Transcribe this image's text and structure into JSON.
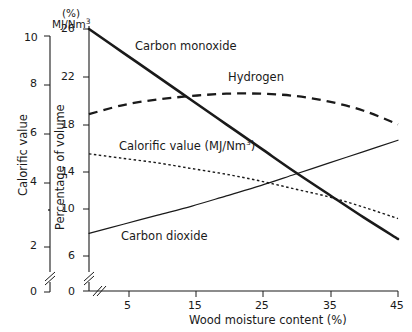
{
  "chart_data": {
    "type": "line",
    "title": "",
    "xlabel": "Wood moisture content (%)",
    "ylabel_left": "Calorific value",
    "ylabel_right": "Percentage of volume",
    "unit_left": "MJ/Nm",
    "unit_left_sup": "3",
    "unit_right": "(%)",
    "xlim": [
      0,
      45
    ],
    "xticks": [
      5,
      15,
      25,
      35,
      45
    ],
    "xticklabels": [
      "5",
      "15",
      "25",
      "35",
      "45"
    ],
    "ylim_left": [
      0,
      10
    ],
    "yticks_left": [
      0,
      2,
      4,
      6,
      8,
      10
    ],
    "yticklabels_left": [
      "0",
      "2",
      "4",
      "6",
      "8",
      "10"
    ],
    "ylim_right": [
      0,
      26
    ],
    "yticks_right": [
      0,
      6,
      10,
      14,
      18,
      22,
      26
    ],
    "yticklabels_right": [
      "0",
      "6",
      "10",
      "14",
      "18",
      "22",
      "26"
    ],
    "axis_break_left": true,
    "axis_break_bottom": true,
    "grid": false,
    "legend": "inline-labels",
    "series": [
      {
        "name": "Carbon monoxide",
        "label": "Carbon monoxide",
        "style": "solid-thick",
        "color": "#1a1a1a",
        "axis": "right",
        "x": [
          0,
          5,
          10,
          15,
          20,
          25,
          30,
          35,
          40,
          45
        ],
        "values": [
          26.0,
          23.9,
          21.8,
          19.7,
          17.6,
          15.5,
          13.4,
          11.4,
          9.4,
          7.5
        ]
      },
      {
        "name": "Hydrogen",
        "label": "Hydrogen",
        "style": "dashed",
        "color": "#1a1a1a",
        "axis": "right",
        "x": [
          0,
          5,
          10,
          15,
          20,
          25,
          30,
          35,
          40,
          45
        ],
        "values": [
          18.5,
          19.3,
          19.8,
          20.1,
          20.3,
          20.3,
          20.1,
          19.6,
          18.8,
          17.6
        ]
      },
      {
        "name": "Calorific value (MJ/Nm3)",
        "label": "Calorific value (MJ/Nm",
        "label_sup": "3",
        "label_tail": ")",
        "style": "dotted",
        "color": "#1a1a1a",
        "axis": "left",
        "x": [
          0,
          5,
          10,
          15,
          20,
          25,
          30,
          35,
          40,
          45
        ],
        "values": [
          5.7,
          5.6,
          5.4,
          5.2,
          5.0,
          4.8,
          4.5,
          4.2,
          3.9,
          3.6
        ],
        "values_right_scale": [
          15.0,
          14.6,
          14.2,
          13.7,
          13.2,
          12.6,
          11.9,
          11.2,
          10.3,
          9.3
        ]
      },
      {
        "name": "Carbon dioxide",
        "label": "Carbon dioxide",
        "style": "solid-thin",
        "color": "#1a1a1a",
        "axis": "right",
        "x": [
          0,
          5,
          10,
          15,
          20,
          25,
          30,
          35,
          40,
          45
        ],
        "values": [
          8.0,
          8.8,
          9.6,
          10.4,
          11.3,
          12.2,
          13.2,
          14.2,
          15.2,
          16.2
        ]
      }
    ]
  },
  "labels": {
    "carbon_monoxide": "Carbon monoxide",
    "hydrogen": "Hydrogen",
    "calorific_value": "Calorific value (MJ/Nm",
    "calorific_value_tail": ")",
    "carbon_dioxide": "Carbon dioxide",
    "x_axis_title": "Wood moisture content (%)",
    "y_axis_left_title": "Calorific value",
    "y_axis_right_title": "Percentage of volume",
    "unit_left_head": "MJ/Nm",
    "unit_right_head": "(%)",
    "sup3": "3"
  },
  "ticks": {
    "left": [
      "10",
      "8",
      "6",
      "4",
      "2",
      "0"
    ],
    "right": [
      "26",
      "22",
      "18",
      "14",
      "10",
      "6",
      "0"
    ],
    "bottom": [
      "5",
      "15",
      "25",
      "35",
      "45"
    ]
  },
  "colors": {
    "ink": "#1a1a1a",
    "background": "#ffffff"
  }
}
